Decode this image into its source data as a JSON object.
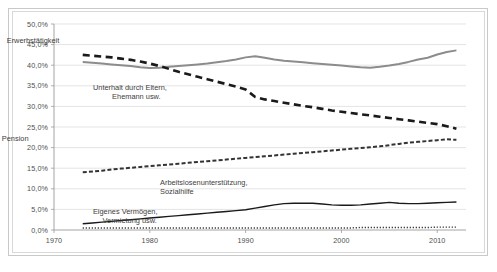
{
  "chart_data": {
    "type": "line",
    "title": "",
    "xlabel": "",
    "ylabel": "",
    "xlim": [
      1970,
      2013
    ],
    "ylim": [
      0,
      50
    ],
    "ytick_format": "percent_de",
    "grid": "horizontal",
    "legend_position": "inline-annotations",
    "xticks": [
      "1970",
      "1980",
      "1990",
      "2000",
      "2010"
    ],
    "xtick_values": [
      1970,
      1980,
      1990,
      2000,
      2010
    ],
    "yticks": [
      "0,0%",
      "5,0%",
      "10,0%",
      "15,0%",
      "20,0%",
      "25,0%",
      "30,0%",
      "35,0%",
      "40,0%",
      "45,0%",
      "50,0%"
    ],
    "ytick_values": [
      0,
      5,
      10,
      15,
      20,
      25,
      30,
      35,
      40,
      45,
      50
    ],
    "x": [
      1973,
      1974,
      1975,
      1976,
      1977,
      1978,
      1979,
      1980,
      1981,
      1982,
      1983,
      1984,
      1985,
      1986,
      1987,
      1988,
      1989,
      1990,
      1991,
      1992,
      1993,
      1994,
      1995,
      1996,
      1997,
      1998,
      1999,
      2000,
      2001,
      2002,
      2003,
      2004,
      2005,
      2006,
      2007,
      2008,
      2009,
      2010,
      2011,
      2012
    ],
    "series": [
      {
        "name": "Erwerbstätigkeit",
        "style": "solid-gray",
        "color": "#8c8c8c",
        "values": [
          40.8,
          40.6,
          40.4,
          40.2,
          40.0,
          39.8,
          39.5,
          39.3,
          39.4,
          39.6,
          39.8,
          40.0,
          40.2,
          40.4,
          40.7,
          41.0,
          41.4,
          41.9,
          42.2,
          41.8,
          41.4,
          41.1,
          40.9,
          40.7,
          40.5,
          40.3,
          40.1,
          39.9,
          39.7,
          39.5,
          39.4,
          39.6,
          39.9,
          40.3,
          40.8,
          41.4,
          41.8,
          42.6,
          43.2,
          43.6
        ]
      },
      {
        "name": "Unterhalt durch Eltern, Ehemann usw.",
        "style": "dashed-thick-black",
        "color": "#1a1a1a",
        "values": [
          42.5,
          42.3,
          42.1,
          41.9,
          41.6,
          41.3,
          40.9,
          40.4,
          39.8,
          39.1,
          38.4,
          37.8,
          37.2,
          36.6,
          36.0,
          35.4,
          34.8,
          34.1,
          32.3,
          31.7,
          31.3,
          30.9,
          30.5,
          30.1,
          29.8,
          29.4,
          29.0,
          28.7,
          28.4,
          28.1,
          27.8,
          27.5,
          27.2,
          26.9,
          26.6,
          26.3,
          26.0,
          25.7,
          25.2,
          24.6
        ]
      },
      {
        "name": "Rente, Pension",
        "style": "dash-dot-small-black",
        "color": "#333333",
        "values": [
          14.0,
          14.2,
          14.4,
          14.7,
          14.9,
          15.1,
          15.3,
          15.5,
          15.7,
          15.9,
          16.1,
          16.3,
          16.5,
          16.7,
          16.9,
          17.1,
          17.3,
          17.5,
          17.7,
          17.9,
          18.1,
          18.3,
          18.5,
          18.7,
          18.9,
          19.1,
          19.3,
          19.5,
          19.7,
          19.9,
          20.1,
          20.3,
          20.6,
          20.9,
          21.2,
          21.4,
          21.6,
          21.8,
          22.0,
          21.9
        ]
      },
      {
        "name": "Arbeitslosenunterstützung, Sozialhilfe",
        "style": "solid-black",
        "color": "#1a1a1a",
        "values": [
          1.5,
          1.7,
          1.9,
          2.1,
          2.3,
          2.5,
          2.7,
          2.9,
          3.1,
          3.3,
          3.5,
          3.7,
          3.9,
          4.1,
          4.3,
          4.5,
          4.7,
          4.9,
          5.3,
          5.7,
          6.1,
          6.4,
          6.5,
          6.5,
          6.5,
          6.3,
          6.1,
          6.0,
          6.0,
          6.1,
          6.3,
          6.5,
          6.7,
          6.5,
          6.4,
          6.4,
          6.5,
          6.6,
          6.7,
          6.8
        ]
      },
      {
        "name": "Eigenes Vermögen, Vermietung usw.",
        "style": "dotted-black",
        "color": "#1a1a1a",
        "values": [
          0.5,
          0.5,
          0.5,
          0.5,
          0.5,
          0.5,
          0.5,
          0.5,
          0.5,
          0.5,
          0.5,
          0.5,
          0.5,
          0.5,
          0.5,
          0.5,
          0.5,
          0.5,
          0.5,
          0.5,
          0.5,
          0.5,
          0.5,
          0.5,
          0.5,
          0.5,
          0.5,
          0.5,
          0.5,
          0.6,
          0.6,
          0.6,
          0.6,
          0.6,
          0.6,
          0.6,
          0.6,
          0.7,
          0.7,
          0.7
        ]
      }
    ],
    "annotations": [
      {
        "text": "Erwerbstätigkeit",
        "x": 1991,
        "y": 45.8
      },
      {
        "text": "Unterhalt durch Eltern,",
        "x": 2000,
        "y": 34.5
      },
      {
        "text": "Ehemann usw.",
        "x": 2002,
        "y": 32.2
      },
      {
        "text": "Rente, Pension",
        "x": 1988,
        "y": 22.0
      },
      {
        "text": "Arbeitslosenunterstützung,",
        "x": 2007,
        "y": 11.5
      },
      {
        "text": "Sozialhilfe",
        "x": 2007,
        "y": 9.3
      },
      {
        "text": "Eigenes Vermögen,",
        "x": 2000,
        "y": 4.3
      },
      {
        "text": "Vermietung usw.",
        "x": 2001,
        "y": 2.2
      }
    ]
  }
}
